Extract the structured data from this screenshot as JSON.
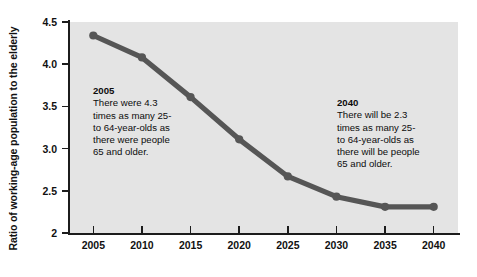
{
  "chart_data": {
    "type": "line",
    "title": "",
    "xlabel": "",
    "ylabel": "Ratio of working-age population to the elderly",
    "categories": [
      "2005",
      "2010",
      "2015",
      "2020",
      "2025",
      "2030",
      "2035",
      "2040"
    ],
    "x": [
      2005,
      2010,
      2015,
      2020,
      2025,
      2030,
      2035,
      2040
    ],
    "values": [
      4.34,
      4.08,
      3.61,
      3.11,
      2.67,
      2.43,
      2.31,
      2.31
    ],
    "series": [
      {
        "name": "Ratio of working-age population to the elderly",
        "values": [
          4.34,
          4.08,
          3.61,
          3.11,
          2.67,
          2.43,
          2.31,
          2.31
        ]
      }
    ],
    "xlim": [
      2002.5,
      2042.5
    ],
    "ylim": [
      2.0,
      4.5
    ],
    "y_ticks": [
      2.0,
      2.5,
      3.0,
      3.5,
      4.0,
      4.5
    ],
    "y_tick_labels": [
      "2",
      "2.5",
      "3.0",
      "3.5",
      "4.0",
      "4.5"
    ],
    "x_ticks": [
      2005,
      2010,
      2015,
      2020,
      2025,
      2030,
      2035,
      2040
    ],
    "x_tick_labels": [
      "2005",
      "2010",
      "2015",
      "2020",
      "2025",
      "2030",
      "2035",
      "2040"
    ],
    "grid": false,
    "legend": false,
    "legend_position": "none",
    "line_color": "#565656",
    "marker_color": "#565656",
    "plot_background": "#e4e4e4",
    "figure_background": "#ffffff",
    "axis_color": "#1c1c1c",
    "annotations": [
      {
        "id": "2005",
        "year": "2005",
        "text": "There were 4.3 times as many 25- to 64-year-olds as there were people 65 and older."
      },
      {
        "id": "2040",
        "year": "2040",
        "text": "There will be 2.3 times as many 25- to 64-year-olds as there will be people 65 and older."
      }
    ]
  },
  "annotation_2005": {
    "year": "2005",
    "line1": "There were 4.3",
    "line2": "times as many 25-",
    "line3": "to 64-year-olds as",
    "line4": "there were people",
    "line5": "65 and older.",
    "body": "There were 4.3\ntimes as many 25-\nto 64-year-olds as\nthere were people\n65 and older."
  },
  "annotation_2040": {
    "year": "2040",
    "line1": "There will be 2.3",
    "line2": "times as many 25-",
    "line3": "to 64-year-olds as",
    "line4": "there will be people",
    "line5": "65 and older.",
    "body": "There will be 2.3\ntimes as many 25-\nto 64-year-olds as\nthere will be people\n65 and older."
  },
  "axes": {
    "y_title": "Ratio of working-age population to the elderly",
    "y_labels": [
      "4.5",
      "4.0",
      "3.5",
      "3.0",
      "2.5",
      "2"
    ],
    "x_labels": [
      "2005",
      "2010",
      "2015",
      "2020",
      "2025",
      "2030",
      "2035",
      "2040"
    ]
  }
}
